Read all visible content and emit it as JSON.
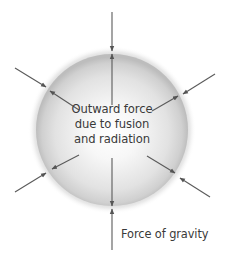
{
  "diagram": {
    "labels": {
      "outward_line1": "Outward force",
      "outward_line2": "due to fusion",
      "outward_line3": "and radiation",
      "gravity": "Force of gravity"
    },
    "sphere": {
      "center": [
        112,
        130
      ],
      "radius": 75,
      "fill_center": "#ffffff",
      "fill_mid": "#e4e4e4",
      "rim_color": "#bcbcbc",
      "halo_color": "#d2d2d2"
    },
    "arrow_color": "#5a5a5a",
    "arrow_pairs": [
      {
        "name": "top",
        "direction": "vertical",
        "gravity_arrow": "inward",
        "outward_arrow": "outward"
      },
      {
        "name": "bottom",
        "direction": "vertical",
        "gravity_arrow": "inward",
        "outward_arrow": "outward"
      },
      {
        "name": "upper-left",
        "direction": "diagonal",
        "gravity_arrow": "inward",
        "outward_arrow": "outward"
      },
      {
        "name": "upper-right",
        "direction": "diagonal",
        "gravity_arrow": "inward",
        "outward_arrow": "outward"
      },
      {
        "name": "lower-left",
        "direction": "diagonal",
        "gravity_arrow": "inward",
        "outward_arrow": "outward"
      },
      {
        "name": "lower-right",
        "direction": "diagonal",
        "gravity_arrow": "inward",
        "outward_arrow": "outward"
      }
    ]
  }
}
